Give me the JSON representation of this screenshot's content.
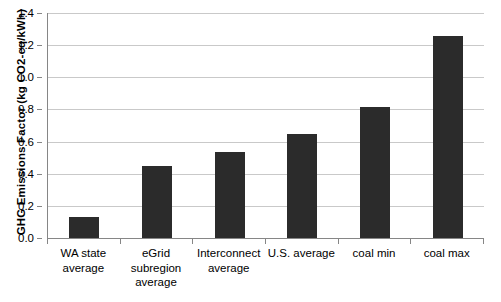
{
  "chart_data": {
    "type": "bar",
    "title": "",
    "subtitle": "",
    "xlabel": "",
    "ylabel": "GHG Emissions Factor (kg CO2-eq/kWh)",
    "categories": [
      "WA state average",
      "eGrid subregion average",
      "Interconnect average",
      "U.S. average",
      "coal min",
      "coal max"
    ],
    "category_lines": [
      [
        "WA state",
        "average"
      ],
      [
        "eGrid",
        "subregion",
        "average"
      ],
      [
        "Interconnect",
        "average"
      ],
      [
        "U.S. average"
      ],
      [
        "coal min"
      ],
      [
        "coal max"
      ]
    ],
    "values": [
      0.13,
      0.45,
      0.535,
      0.65,
      0.815,
      1.26
    ],
    "ylim": [
      0.0,
      1.4
    ],
    "ytick_labels": [
      "0.0",
      "0.2",
      "0.4",
      "0.6",
      "0.8",
      "1.0",
      "1.2",
      "1.4"
    ],
    "ytick_values": [
      0.0,
      0.2,
      0.4,
      0.6,
      0.8,
      1.0,
      1.2,
      1.4
    ],
    "grid": "horizontal",
    "legend": "none",
    "bar_color": "#2b2b2b",
    "gridline_color": "#c9c9c9",
    "axis_color": "#868686"
  }
}
